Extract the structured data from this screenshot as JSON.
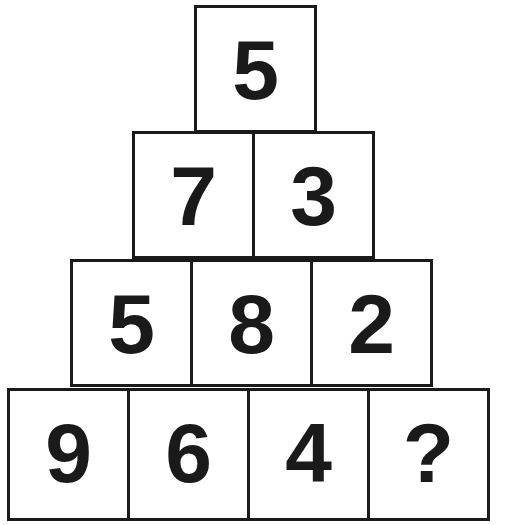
{
  "puzzle": {
    "rows": [
      [
        "5"
      ],
      [
        "7",
        "3"
      ],
      [
        "5",
        "8",
        "2"
      ],
      [
        "9",
        "6",
        "4",
        "?"
      ]
    ]
  },
  "colors": {
    "border": "#1a1a1a",
    "text": "#1a1a1a",
    "background": "#ffffff"
  }
}
